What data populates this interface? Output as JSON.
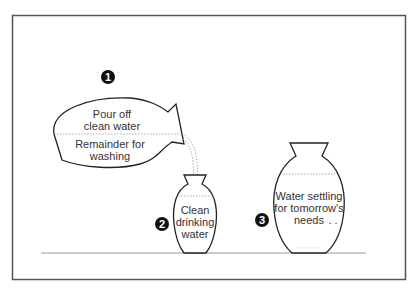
{
  "diagram": {
    "colors": {
      "stroke": "#222222",
      "text": "#333333",
      "frame": "#555555",
      "ground": "#999999",
      "dotted": "#999999"
    },
    "steps": [
      {
        "number": "1",
        "pot": "pouring-pot",
        "labels": [
          "Pour off",
          "clean water",
          "Remainder for",
          "washing"
        ]
      },
      {
        "number": "2",
        "pot": "small-jar",
        "labels": [
          "Clean",
          "drinking",
          "water"
        ]
      },
      {
        "number": "3",
        "pot": "large-jar",
        "labels": [
          "Water settling",
          "for tomorrow's",
          "needs"
        ]
      }
    ]
  }
}
